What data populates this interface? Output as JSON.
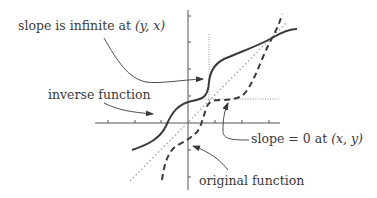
{
  "labels": {
    "slope_infinite_prefix": "slope is infinite at ",
    "slope_infinite_point": "(y, x)",
    "inverse_function": "inverse function",
    "slope_zero_prefix": "slope = 0 at ",
    "slope_zero_point": "(x, y)",
    "original_function": "original function"
  },
  "colors": {
    "curve": "#3a3a3a",
    "axis": "#555555",
    "dotted": "#888888",
    "text": "#3a3a3a"
  },
  "curves": {
    "inverse_function": {
      "style": "solid"
    },
    "original_function": {
      "style": "dashed"
    },
    "identity_line": {
      "style": "dotted",
      "description": "y = x"
    }
  }
}
